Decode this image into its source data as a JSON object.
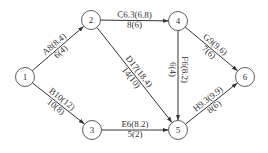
{
  "diagram": {
    "type": "activity-network",
    "colors": {
      "line": "#333333",
      "node_fill": "#ffffff",
      "text": "#333333"
    },
    "nodes": [
      {
        "id": "1",
        "label": "1",
        "x": 25,
        "y": 77
      },
      {
        "id": "2",
        "label": "2",
        "x": 91,
        "y": 20
      },
      {
        "id": "3",
        "label": "3",
        "x": 92,
        "y": 130
      },
      {
        "id": "4",
        "label": "4",
        "x": 178,
        "y": 21
      },
      {
        "id": "5",
        "label": "5",
        "x": 178,
        "y": 130
      },
      {
        "id": "6",
        "label": "6",
        "x": 245,
        "y": 77
      }
    ],
    "edges": [
      {
        "from": "1",
        "to": "2",
        "top": "A8(8.4)",
        "bottom": "6(4)"
      },
      {
        "from": "1",
        "to": "3",
        "top": "B10(12)",
        "bottom": "10(8)"
      },
      {
        "from": "2",
        "to": "4",
        "top": "C6.3(6.8)",
        "bottom": "8(6)"
      },
      {
        "from": "2",
        "to": "5",
        "top": "D17(18.4)",
        "bottom": "14(10)"
      },
      {
        "from": "3",
        "to": "5",
        "top": "E6(8.2)",
        "bottom": "5(2)"
      },
      {
        "from": "4",
        "to": "5",
        "top": "F6(8.2)",
        "bottom": "6(4)"
      },
      {
        "from": "4",
        "to": "6",
        "top": "G9(9.6)",
        "bottom": "7(6)"
      },
      {
        "from": "5",
        "to": "6",
        "top": "H9.3(9.9)",
        "bottom": "8(6)"
      }
    ]
  }
}
